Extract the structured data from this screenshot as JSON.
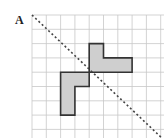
{
  "figure": {
    "label": "A",
    "colors": {
      "grid": "#c8c8c8",
      "shape_fill": "#cfcfcf",
      "shape_stroke": "#333333",
      "mirror_line": "#444444"
    },
    "grid_units": {
      "columns": 10,
      "rows": 9
    },
    "mirror_line": {
      "style": "dashed",
      "from": [
        0,
        0
      ],
      "to": [
        9.5,
        9
      ]
    },
    "shapes": [
      {
        "name": "upper-l-shape",
        "vertices_grid": [
          [
            4,
            2
          ],
          [
            5,
            2
          ],
          [
            5,
            3
          ],
          [
            7,
            3
          ],
          [
            7,
            4
          ],
          [
            4,
            4
          ]
        ]
      },
      {
        "name": "lower-l-shape",
        "vertices_grid": [
          [
            2,
            4
          ],
          [
            4,
            4
          ],
          [
            4,
            5
          ],
          [
            3,
            5
          ],
          [
            3,
            7
          ],
          [
            2,
            7
          ]
        ]
      }
    ]
  }
}
